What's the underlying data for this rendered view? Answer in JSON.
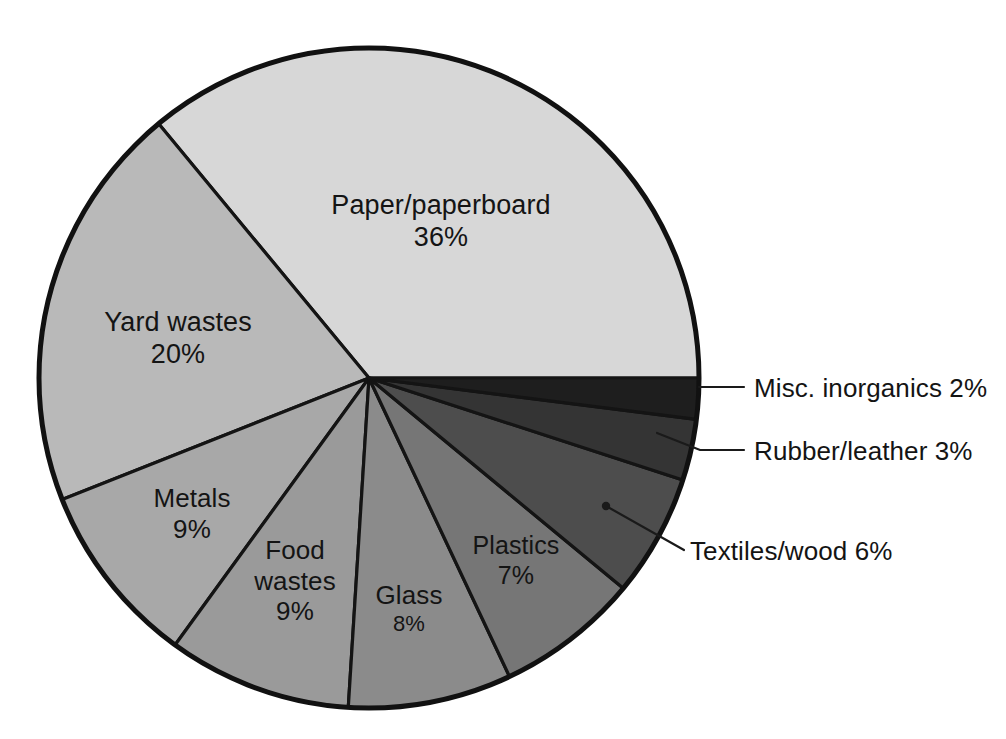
{
  "chart_data": {
    "type": "pie",
    "title": "",
    "subtitle": "",
    "xlabel": "",
    "ylabel": "",
    "legend_position": "none",
    "grid": false,
    "units": "percent",
    "total": 100,
    "categories": [
      "Paper/paperboard",
      "Yard wastes",
      "Metals",
      "Food wastes",
      "Glass",
      "Plastics",
      "Textiles/wood",
      "Rubber/leather",
      "Misc. inorganics"
    ],
    "values": [
      36,
      20,
      9,
      9,
      8,
      7,
      6,
      3,
      2
    ],
    "slices": [
      {
        "name": "Paper/paperboard",
        "label": "Paper/paperboard",
        "value": 36,
        "value_text": "36%",
        "color": "#d7d7d7",
        "label_placement": "inside"
      },
      {
        "name": "Yard wastes",
        "label": "Yard wastes",
        "value": 20,
        "value_text": "20%",
        "color": "#b9b9b9",
        "label_placement": "inside"
      },
      {
        "name": "Metals",
        "label": "Metals",
        "value": 9,
        "value_text": "9%",
        "color": "#a8a8a8",
        "label_placement": "inside"
      },
      {
        "name": "Food wastes",
        "label": "Food wastes",
        "value": 9,
        "value_text": "9%",
        "color": "#9a9a9a",
        "label_placement": "inside"
      },
      {
        "name": "Glass",
        "label": "Glass",
        "value": 8,
        "value_text": "8%",
        "color": "#8b8b8b",
        "label_placement": "inside"
      },
      {
        "name": "Plastics",
        "label": "Plastics",
        "value": 7,
        "value_text": "7%",
        "color": "#767676",
        "label_placement": "inside"
      },
      {
        "name": "Textiles/wood",
        "label": "Textiles/wood 6%",
        "value": 6,
        "value_text": "6%",
        "color": "#4d4d4d",
        "label_placement": "outside"
      },
      {
        "name": "Rubber/leather",
        "label": "Rubber/leather 3%",
        "value": 3,
        "value_text": "3%",
        "color": "#343434",
        "label_placement": "outside"
      },
      {
        "name": "Misc. inorganics",
        "label": "Misc. inorganics 2%",
        "value": 2,
        "value_text": "2%",
        "color": "#1e1e1e",
        "label_placement": "outside"
      }
    ]
  },
  "labels": {
    "paper": {
      "name": "Paper/paperboard",
      "value": "36%"
    },
    "yard": {
      "name": "Yard wastes",
      "value": "20%"
    },
    "metals": {
      "name": "Metals",
      "value": "9%"
    },
    "food_line1": "Food",
    "food_line2": "wastes",
    "food_value": "9%",
    "glass": {
      "name": "Glass",
      "value": "8%"
    },
    "plastics": {
      "name": "Plastics",
      "value": "7%"
    },
    "misc_inorganics": "Misc. inorganics 2%",
    "rubber_leather": "Rubber/leather 3%",
    "textiles_wood": "Textiles/wood 6%"
  },
  "colors": {
    "background": "#ffffff",
    "outline": "#111111",
    "text": "#141414"
  }
}
